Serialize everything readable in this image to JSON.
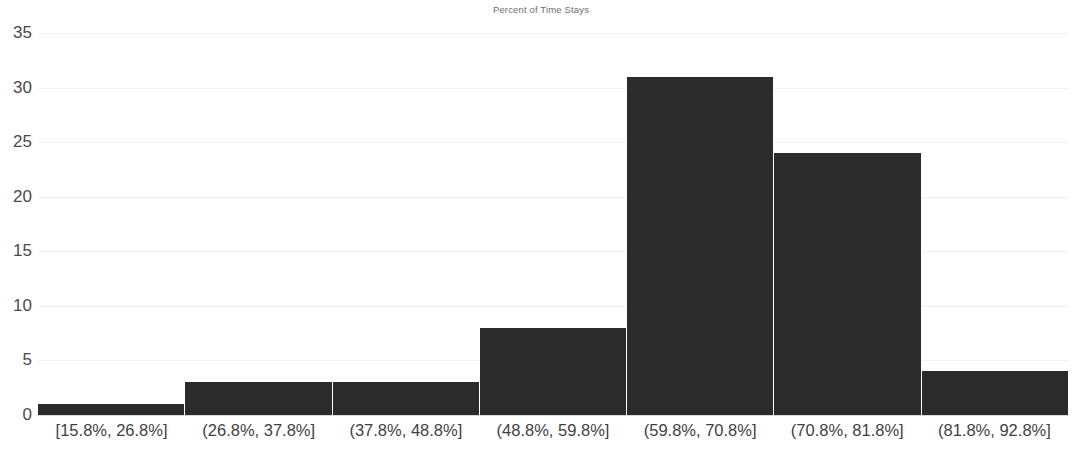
{
  "chart_data": {
    "type": "bar",
    "title": "Percent of Time Stays",
    "xlabel": "",
    "ylabel": "",
    "categories": [
      "[15.8%, 26.8%]",
      "(26.8%, 37.8%]",
      "(37.8%, 48.8%]",
      "(48.8%, 59.8%]",
      "(59.8%, 70.8%]",
      "(70.8%, 81.8%]",
      "(81.8%, 92.8%]"
    ],
    "values": [
      1,
      3,
      3,
      8,
      31,
      24,
      4
    ],
    "ylim": [
      0,
      35
    ],
    "yticks": [
      0,
      5,
      10,
      15,
      20,
      25,
      30,
      35
    ],
    "ytick_labels": [
      "0",
      "5",
      "10",
      "15",
      "20",
      "25",
      "30",
      "35"
    ],
    "grid": true,
    "legend": false,
    "bar_color": "#2b2b2b",
    "gridline_color": "#f1f1f1",
    "axis_color": "#d9d9d9",
    "title_color": "#6e6e6e",
    "tick_label_color": "#4a4a4a"
  }
}
